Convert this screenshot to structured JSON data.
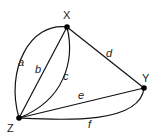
{
  "graph": {
    "nodes": [
      {
        "id": "X",
        "label": "X",
        "x": 67,
        "y": 27,
        "lx": 63,
        "ly": 19
      },
      {
        "id": "Y",
        "label": "Y",
        "x": 144,
        "y": 88,
        "lx": 142,
        "ly": 82
      },
      {
        "id": "Z",
        "label": "Z",
        "x": 19,
        "y": 118,
        "lx": 7,
        "ly": 132
      }
    ],
    "edges": [
      {
        "id": "a",
        "label": "a",
        "from": "X",
        "to": "Z",
        "lx": 18,
        "ly": 66
      },
      {
        "id": "b",
        "label": "b",
        "from": "X",
        "to": "Z",
        "lx": 35,
        "ly": 73
      },
      {
        "id": "c",
        "label": "c",
        "from": "X",
        "to": "Z",
        "lx": 63,
        "ly": 80
      },
      {
        "id": "d",
        "label": "d",
        "from": "X",
        "to": "Y",
        "lx": 106,
        "ly": 57
      },
      {
        "id": "e",
        "label": "e",
        "from": "Z",
        "to": "Y",
        "lx": 78,
        "ly": 99
      },
      {
        "id": "f",
        "label": "f",
        "from": "Z",
        "to": "Y",
        "lx": 88,
        "ly": 128
      }
    ]
  }
}
